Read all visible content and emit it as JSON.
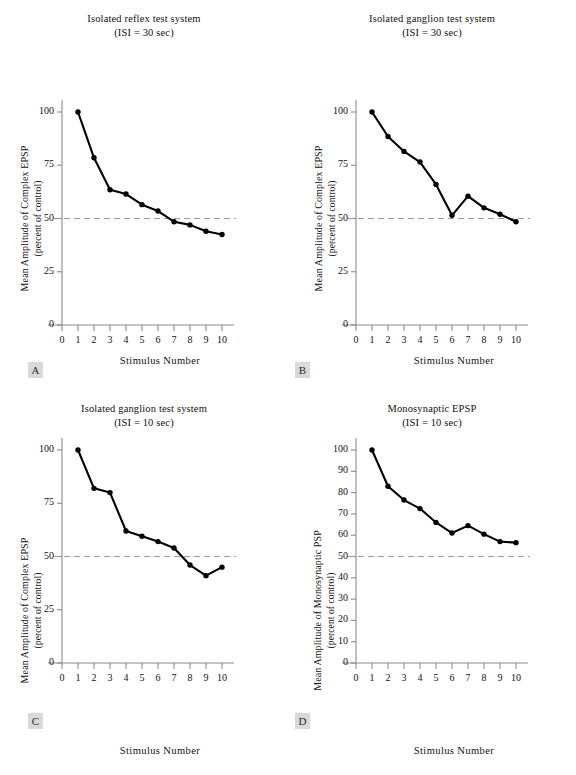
{
  "figure": {
    "panels": [
      {
        "tag": "A",
        "title_line1": "Isolated reflex test system",
        "title_line2": "(ISI = 30 sec)",
        "ylabel_line1": "Mean Amplitude of Complex EPSP",
        "ylabel_line2": "(percent of control)",
        "xlabel": "Stimulus Number"
      },
      {
        "tag": "B",
        "title_line1": "Isolated ganglion test system",
        "title_line2": "(ISI = 30 sec)",
        "ylabel_line1": "Mean Amplitude of Complex EPSP",
        "ylabel_line2": "(percent of control)",
        "xlabel": "Stimulus Number"
      },
      {
        "tag": "C",
        "title_line1": "Isolated ganglion test system",
        "title_line2": "(ISI = 10 sec)",
        "ylabel_line1": "Mean Amplitude of Complex EPSP",
        "ylabel_line2": "(percent of control)",
        "xlabel": "Stimulus Number"
      },
      {
        "tag": "D",
        "title_line1": "Monosynaptic EPSP",
        "title_line2": "(ISI = 10 sec)",
        "ylabel_line1": "Mean Amplitude of Monosynaptic PSP",
        "ylabel_line2": "(percent of control)",
        "xlabel": "Stimulus Number"
      }
    ]
  },
  "chart_data": [
    {
      "type": "line",
      "panel": "A",
      "title": "Isolated reflex test system (ISI = 30 sec)",
      "xlabel": "Stimulus Number",
      "ylabel": "Mean Amplitude of Complex EPSP (percent of control)",
      "x": [
        1,
        2,
        3,
        4,
        5,
        6,
        7,
        8,
        9,
        10
      ],
      "values": [
        100,
        78.5,
        63.5,
        61.5,
        56.5,
        53.5,
        48.5,
        47,
        44,
        42.5
      ],
      "xlim": [
        0,
        10
      ],
      "ylim": [
        0,
        100
      ],
      "xticks": [
        0,
        1,
        2,
        3,
        4,
        5,
        6,
        7,
        8,
        9,
        10
      ],
      "yticks": [
        0,
        25,
        50,
        75,
        100
      ],
      "reference_line": 50,
      "reference_line_style": "dashed",
      "grid": false,
      "legend": "none",
      "marker": "filled-circle"
    },
    {
      "type": "line",
      "panel": "B",
      "title": "Isolated ganglion test system (ISI = 30 sec)",
      "xlabel": "Stimulus Number",
      "ylabel": "Mean Amplitude of Complex EPSP (percent of control)",
      "x": [
        1,
        2,
        3,
        4,
        5,
        6,
        7,
        8,
        9,
        10
      ],
      "values": [
        100,
        88.5,
        81.5,
        76.5,
        66,
        51.5,
        60.5,
        55,
        52,
        48.5
      ],
      "xlim": [
        0,
        10
      ],
      "ylim": [
        0,
        100
      ],
      "xticks": [
        0,
        1,
        2,
        3,
        4,
        5,
        6,
        7,
        8,
        9,
        10
      ],
      "yticks": [
        0,
        25,
        50,
        75,
        100
      ],
      "reference_line": 50,
      "reference_line_style": "dashed",
      "grid": false,
      "legend": "none",
      "marker": "filled-circle"
    },
    {
      "type": "line",
      "panel": "C",
      "title": "Isolated ganglion test system (ISI = 10 sec)",
      "xlabel": "Stimulus Number",
      "ylabel": "Mean Amplitude of Complex EPSP (percent of control)",
      "x": [
        1,
        2,
        3,
        4,
        5,
        6,
        7,
        8,
        9,
        10
      ],
      "values": [
        100,
        82,
        80,
        62,
        59.5,
        57,
        54,
        46,
        41,
        45
      ],
      "xlim": [
        0,
        10
      ],
      "ylim": [
        0,
        100
      ],
      "xticks": [
        0,
        1,
        2,
        3,
        4,
        5,
        6,
        7,
        8,
        9,
        10
      ],
      "yticks": [
        0,
        25,
        50,
        75,
        100
      ],
      "reference_line": 50,
      "reference_line_style": "dashed",
      "grid": false,
      "legend": "none",
      "marker": "filled-circle"
    },
    {
      "type": "line",
      "panel": "D",
      "title": "Monosynaptic EPSP (ISI = 10 sec)",
      "xlabel": "Stimulus Number",
      "ylabel": "Mean Amplitude of Monosynaptic PSP (percent of control)",
      "x": [
        1,
        2,
        3,
        4,
        5,
        6,
        7,
        8,
        9,
        10
      ],
      "values": [
        100,
        83,
        76.5,
        72.5,
        66,
        61,
        64.5,
        60.5,
        57,
        56.5
      ],
      "xlim": [
        0,
        10
      ],
      "ylim": [
        0,
        100
      ],
      "xticks": [
        0,
        1,
        2,
        3,
        4,
        5,
        6,
        7,
        8,
        9,
        10
      ],
      "yticks": [
        0,
        10,
        20,
        30,
        40,
        50,
        60,
        70,
        80,
        90,
        100
      ],
      "reference_line": 50,
      "reference_line_style": "dashed",
      "grid": false,
      "legend": "none",
      "marker": "filled-circle"
    }
  ]
}
